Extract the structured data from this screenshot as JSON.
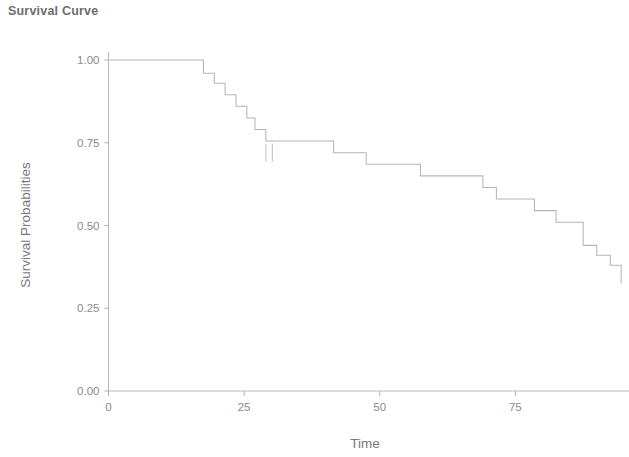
{
  "chart_data": {
    "type": "line",
    "subtype": "kaplan-meier-step",
    "title": "Survival Curve",
    "xlabel": "Time",
    "ylabel": "Survival Probabilities",
    "xlim": [
      -2,
      96
    ],
    "ylim": [
      0.0,
      1.0
    ],
    "grid": false,
    "legend": null,
    "xticks": [
      0,
      25,
      50,
      75
    ],
    "xtick_labels": [
      "0",
      "25",
      "50",
      "75"
    ],
    "yticks": [
      0.0,
      0.25,
      0.5,
      0.75,
      1.0
    ],
    "ytick_labels": [
      "0.00",
      "0.25",
      "0.50",
      "0.75",
      "1.00"
    ],
    "line_color": "#b5b5b5",
    "series": [
      {
        "name": "Survival",
        "x": [
          0,
          15.5,
          17.5,
          19.5,
          21.5,
          23.5,
          25.5,
          27.0,
          29.0,
          41.5,
          47.5,
          52.5,
          57.5,
          69.0,
          71.5,
          78.5,
          82.5,
          85.5,
          87.5,
          90.0,
          92.5,
          94.5
        ],
        "y": [
          1.0,
          1.0,
          0.96,
          0.93,
          0.895,
          0.86,
          0.825,
          0.79,
          0.755,
          0.72,
          0.685,
          0.685,
          0.65,
          0.615,
          0.58,
          0.545,
          0.51,
          0.51,
          0.44,
          0.41,
          0.38,
          0.325
        ]
      }
    ],
    "censor_times": [
      29.0,
      30.2
    ],
    "censor_value": 0.72,
    "final_value": 0.325
  },
  "title_text": "Survival Curve",
  "icons": {
    "censor": "censor-tick-icon"
  }
}
